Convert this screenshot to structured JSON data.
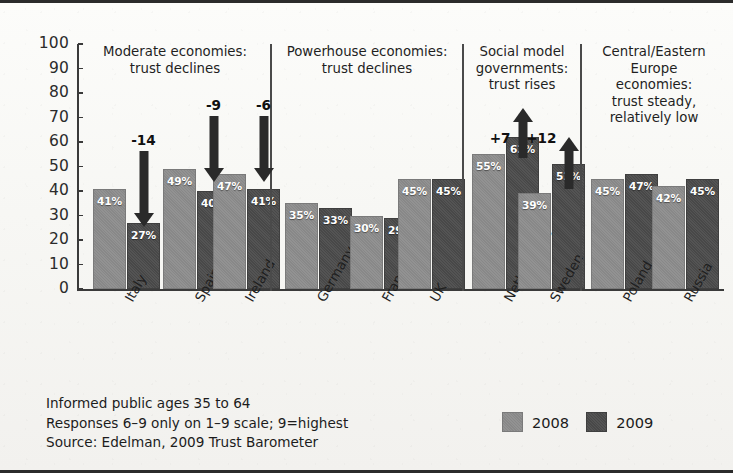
{
  "chart_data": {
    "type": "bar",
    "title": "",
    "subtitle": "",
    "xlabel": "",
    "ylabel": "",
    "ylim": [
      0,
      100
    ],
    "yticks": [
      0,
      10,
      20,
      30,
      40,
      50,
      60,
      70,
      80,
      90,
      100
    ],
    "grid": false,
    "legend_position": "bottom-right",
    "categories": [
      "Italy",
      "Spain",
      "Ireland",
      "Germany",
      "France",
      "UK",
      "Netherlands",
      "Sweden",
      "Poland",
      "Russia"
    ],
    "series": [
      {
        "name": "2008",
        "color": "#8c8c8c",
        "values": [
          41,
          49,
          47,
          35,
          30,
          45,
          55,
          39,
          45,
          42
        ]
      },
      {
        "name": "2009",
        "color": "#4b4b4b",
        "values": [
          27,
          40,
          41,
          33,
          29,
          45,
          62,
          51,
          47,
          45
        ]
      }
    ],
    "value_labels": {
      "2008": [
        "41%",
        "49%",
        "47%",
        "35%",
        "30%",
        "45%",
        "55%",
        "39%",
        "45%",
        "42%"
      ],
      "2009": [
        "27%",
        "40%",
        "41%",
        "33%",
        "29%",
        "45%",
        "62%",
        "51%",
        "47%",
        "45%"
      ]
    },
    "annotations": [
      {
        "category": "Italy",
        "label": "-14",
        "direction": "down"
      },
      {
        "category": "Spain",
        "label": "-9",
        "direction": "down"
      },
      {
        "category": "Ireland",
        "label": "-6",
        "direction": "down"
      },
      {
        "category": "Netherlands",
        "label": "+7",
        "direction": "up"
      },
      {
        "category": "Sweden",
        "label": "+12",
        "direction": "up"
      }
    ],
    "groups": [
      {
        "name": "moderate",
        "lines": [
          "Moderate economies:",
          "trust declines"
        ],
        "categories": [
          "Italy",
          "Spain",
          "Ireland"
        ]
      },
      {
        "name": "powerhouse",
        "lines": [
          "Powerhouse economies:",
          "trust declines"
        ],
        "categories": [
          "Germany",
          "France",
          "UK"
        ]
      },
      {
        "name": "social-model",
        "lines": [
          "Social model",
          "governments:",
          "trust rises"
        ],
        "categories": [
          "Netherlands",
          "Sweden"
        ]
      },
      {
        "name": "central-eastern",
        "lines": [
          "Central/Eastern",
          "Europe",
          "economies:",
          "trust steady,",
          "relatively low"
        ],
        "categories": [
          "Poland",
          "Russia"
        ]
      }
    ],
    "footnotes": [
      "Informed public ages 35 to 64",
      "Responses 6–9 only on 1–9 scale; 9=highest",
      "Source: Edelman, 2009 Trust Barometer"
    ]
  }
}
